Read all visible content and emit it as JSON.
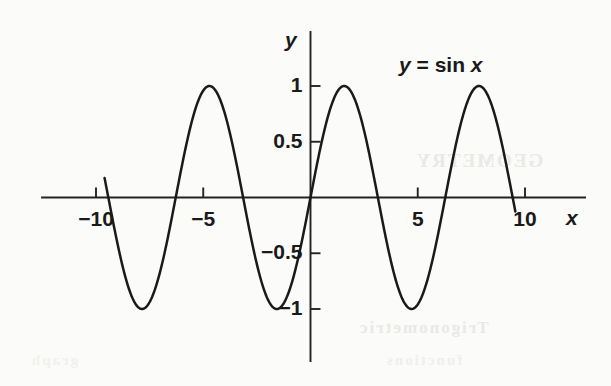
{
  "figure": {
    "background_color": "#fbfbf9",
    "ink_color": "#1a1a1a",
    "annotation": {
      "full_text": "y = sin x",
      "var_y": "y",
      "equals": "=",
      "func": "sin",
      "var_x": "x"
    },
    "axis_labels": {
      "x": "x",
      "y": "y"
    },
    "ghost_text": {
      "a": "GEOMETRY",
      "b": "Trigonometric",
      "c": "functions",
      "d": "graph"
    }
  },
  "chart_data": {
    "type": "line",
    "title": "",
    "subtitle": "",
    "annotations": [
      "y = sin x"
    ],
    "xlabel": "x",
    "ylabel": "y",
    "xlim": [
      -12.5,
      12.7
    ],
    "ylim": [
      -1.5,
      1.5
    ],
    "grid": false,
    "legend_position": "none",
    "xticks": [
      -10,
      -5,
      5,
      10
    ],
    "xtick_labels": [
      "−10",
      "−5",
      "5",
      "10"
    ],
    "yticks": [
      1,
      0.5,
      -0.5,
      -1
    ],
    "ytick_labels": [
      "1",
      "0.5",
      "−0.5",
      "−1"
    ],
    "series": [
      {
        "name": "y = sin x",
        "equation": "y = sin(x)",
        "x_start": -9.6,
        "x_end": 9.55,
        "amplitude": 1,
        "period": 6.283185307,
        "x": [
          -9.6,
          -9.0,
          -8.5,
          -8.0,
          -7.854,
          -7.5,
          -7.0,
          -6.5,
          -6.283,
          -6.0,
          -5.5,
          -5.0,
          -4.712,
          -4.5,
          -4.0,
          -3.5,
          -3.142,
          -3.0,
          -2.5,
          -2.0,
          -1.571,
          -1.5,
          -1.0,
          -0.5,
          0.0,
          0.5,
          1.0,
          1.571,
          2.0,
          2.5,
          3.0,
          3.142,
          3.5,
          4.0,
          4.5,
          4.712,
          5.0,
          5.5,
          6.0,
          6.283,
          6.5,
          7.0,
          7.5,
          7.854,
          8.0,
          8.5,
          9.0,
          9.55
        ],
        "y": [
          0.174,
          0.412,
          0.798,
          0.989,
          1.0,
          0.938,
          0.657,
          0.216,
          0.0,
          -0.279,
          -0.706,
          -0.959,
          -1.0,
          -0.978,
          -0.757,
          -0.351,
          0.0,
          0.141,
          0.598,
          0.909,
          1.0,
          0.997,
          0.841,
          0.479,
          0.0,
          -0.479,
          -0.841,
          -1.0,
          -0.909,
          -0.598,
          -0.141,
          0.0,
          0.351,
          0.757,
          0.978,
          1.0,
          0.959,
          0.706,
          0.279,
          0.0,
          -0.216,
          -0.657,
          -0.938,
          -1.0,
          -0.989,
          -0.798,
          -0.412,
          -0.128
        ]
      }
    ],
    "maxima_x": [
      -7.854,
      1.571,
      7.854
    ],
    "minima_x": [
      -4.712,
      -1.571,
      4.712
    ],
    "zero_crossings": [
      -9.425,
      -6.283,
      -3.142,
      0,
      3.142,
      6.283,
      9.425
    ]
  }
}
